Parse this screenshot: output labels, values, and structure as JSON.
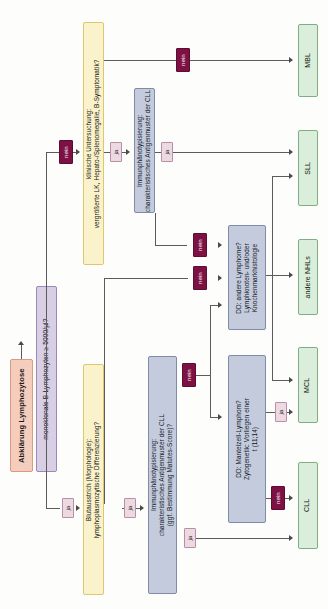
{
  "diagram": {
    "title": "Abklärung Lymphozytose",
    "orientation": "rotated-90-ccw",
    "nodes": {
      "start": "Abklärung Lymphozytose",
      "monoclonal": "monoklonale B-Lymphozyten ≥ 5000/µl?",
      "clinical_exam": "klinische Untersuchung:\nvergrößerte LK, Hepato-/Splenomegalie, B-Symptomatik?",
      "clinical_exam_line1": "klinische Untersuchung:",
      "clinical_exam_line2": "vergrößerte LK, Hepato-/Splenomegalie, B-Symptomatik?",
      "immuno_top_line1": "Immunphänotypisierung:",
      "immuno_top_line2": "charakteristisches Antigenmuster der CLL",
      "blood_smear_line1": "Blutausstrich (Morphologie):",
      "blood_smear_line2": "lymphoplasmozytische Differenzierung?",
      "immuno_bottom_line1": "Immunphänotypisierung:",
      "immuno_bottom_line2": "charakteristisches Antigenmuster der CLL",
      "immuno_bottom_line3": "(ggf. Bestimmung Matutes-Score)?",
      "dd_other_line1": "DD: andere Lymphome?",
      "dd_other_line2": "Lymphknoten- und/oder",
      "dd_other_line3": "Knochenmarkhistologie",
      "dd_mantle_line1": "DD: Mantelzell-Lymphom?",
      "dd_mantle_line2": "Zytogenetik: Vorliegen einer",
      "dd_mantle_line3": "t (11;14)"
    },
    "outcomes": {
      "mbl": "MBL",
      "sll": "SLL",
      "other_nhl": "andere NHLs",
      "mcl": "MCL",
      "cll": "CLL"
    },
    "labels": {
      "ja": "ja",
      "nein": "nein"
    },
    "colors": {
      "start_fill": "#f4cdbd",
      "start_border": "#d79a82",
      "decision_lavender_fill": "#d8cfe4",
      "decision_lavender_border": "#9c86bb",
      "decision_yellow_fill": "#faf2ca",
      "decision_yellow_border": "#ddc96b",
      "process_blue_fill": "#c3cbdd",
      "process_blue_border": "#7f8ba8",
      "terminal_green_fill": "#dbeedb",
      "terminal_green_border": "#7fae82",
      "label_ja_fill": "#ecd9e2",
      "label_nein_fill": "#7d1144",
      "connector": "#5b5b5b"
    }
  }
}
